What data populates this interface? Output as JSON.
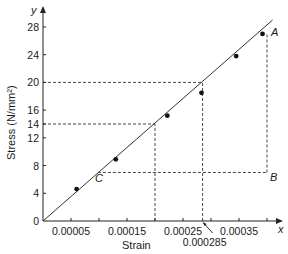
{
  "chart_data": {
    "type": "scatter",
    "title": "",
    "xlabel": "Strain",
    "ylabel": "Stress (N/mm²)",
    "x_axis_letter": "x",
    "y_axis_letter": "y",
    "xlim": [
      0,
      0.00043
    ],
    "ylim": [
      0,
      30
    ],
    "grid": false,
    "x_ticks": [
      {
        "value": 5e-05,
        "label": "0.00005"
      },
      {
        "value": 0.0001,
        "label": ""
      },
      {
        "value": 0.00015,
        "label": "0.00015"
      },
      {
        "value": 0.0002,
        "label": ""
      },
      {
        "value": 0.00025,
        "label": "0.00025"
      },
      {
        "value": 0.0003,
        "label": ""
      },
      {
        "value": 0.00035,
        "label": "0.00035"
      },
      {
        "value": 0.0004,
        "label": ""
      }
    ],
    "y_ticks": [
      {
        "value": 0,
        "label": "0"
      },
      {
        "value": 4,
        "label": "4"
      },
      {
        "value": 8,
        "label": "8"
      },
      {
        "value": 12,
        "label": "12"
      },
      {
        "value": 14,
        "label": "14"
      },
      {
        "value": 16,
        "label": "16"
      },
      {
        "value": 20,
        "label": "20"
      },
      {
        "value": 24,
        "label": "24"
      },
      {
        "value": 28,
        "label": "28"
      }
    ],
    "series": [
      {
        "name": "Measured points",
        "points": [
          {
            "x": 6e-05,
            "y": 4.6
          },
          {
            "x": 0.00013,
            "y": 8.9
          },
          {
            "x": 0.000222,
            "y": 15.2
          },
          {
            "x": 0.000283,
            "y": 18.5
          },
          {
            "x": 0.000345,
            "y": 23.8
          },
          {
            "x": 0.000392,
            "y": 27.0
          }
        ]
      }
    ],
    "fit_line": {
      "x0": 0,
      "y0": 0,
      "x1": 0.00041,
      "y1": 29.0,
      "slope_label": "best-fit line through origin"
    },
    "annotations": [
      {
        "label": "A",
        "x": 0.0004,
        "y": 27.2
      },
      {
        "label": "B",
        "x": 0.0004,
        "y": 7.0
      },
      {
        "label": "C",
        "x": 9.8e-05,
        "y": 7.0
      },
      {
        "label": "0.000285",
        "x": 0.000285,
        "y": 0,
        "note": "arrow pointing to x-axis"
      }
    ],
    "dashed_guides": [
      {
        "type": "h",
        "y": 20,
        "x_from": 0,
        "x_to": 0.000285
      },
      {
        "type": "v",
        "x": 0.000285,
        "y_from": 0,
        "y_to": 20
      },
      {
        "type": "h",
        "y": 14,
        "x_from": 0,
        "x_to": 0.0002
      },
      {
        "type": "v",
        "x": 0.0002,
        "y_from": 0,
        "y_to": 14
      },
      {
        "type": "v",
        "x": 0.0004,
        "y_from": 7.0,
        "y_to": 27.2
      },
      {
        "type": "h",
        "y": 7.0,
        "x_from": 9.8e-05,
        "x_to": 0.0004
      }
    ]
  },
  "colors": {
    "line": "#333333",
    "points": "#111111",
    "text": "#1a1a1a",
    "background": "#ffffff"
  }
}
